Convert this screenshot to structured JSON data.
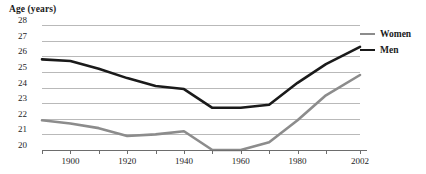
{
  "chart_data": {
    "type": "line",
    "title": "Age (years)",
    "xlabel": "",
    "ylabel": "Age (years)",
    "ylim": [
      20,
      28
    ],
    "xlim": [
      1890,
      2002
    ],
    "grid": true,
    "legend_position": "right",
    "y_ticks": [
      28,
      27,
      26,
      25,
      24,
      23,
      22,
      21,
      20
    ],
    "x_ticks": [
      1890,
      1900,
      1910,
      1920,
      1930,
      1940,
      1950,
      1960,
      1970,
      1980,
      1990,
      2002
    ],
    "x_tick_labels": [
      "",
      "1900",
      "",
      "1920",
      "",
      "1940",
      "",
      "1960",
      "",
      "1980",
      "",
      "2002"
    ],
    "series": [
      {
        "name": "Men",
        "color": "#1a1a1a",
        "x": [
          1890,
          1900,
          1910,
          1920,
          1930,
          1940,
          1950,
          1960,
          1970,
          1980,
          1990,
          2002
        ],
        "values": [
          25.8,
          25.7,
          25.2,
          24.6,
          24.1,
          23.9,
          22.7,
          22.7,
          22.9,
          24.3,
          25.5,
          26.6
        ]
      },
      {
        "name": "Women",
        "color": "#8c8c8c",
        "x": [
          1890,
          1900,
          1910,
          1920,
          1930,
          1940,
          1950,
          1960,
          1970,
          1980,
          1990,
          2002
        ],
        "values": [
          21.9,
          21.7,
          21.4,
          20.9,
          21.0,
          21.2,
          20.0,
          20.0,
          20.5,
          21.9,
          23.5,
          24.8
        ]
      }
    ]
  },
  "legend": {
    "items": [
      {
        "label": "Women",
        "color": "#8c8c8c"
      },
      {
        "label": "Men",
        "color": "#1a1a1a"
      }
    ]
  }
}
